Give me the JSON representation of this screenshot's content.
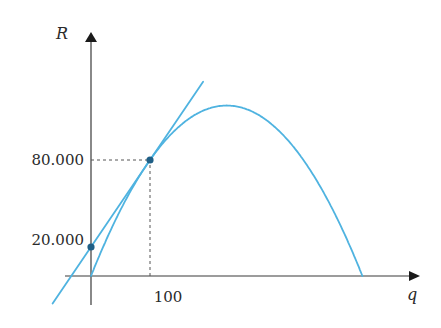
{
  "chart_data": {
    "type": "line",
    "title": "",
    "xlabel": "q",
    "ylabel": "R",
    "xlim": [
      -40,
      540
    ],
    "ylim": [
      -18000,
      165000
    ],
    "grid": false,
    "legend": "none",
    "x_ticks": [
      {
        "value": 100,
        "label": "100"
      }
    ],
    "y_ticks": [
      {
        "value": 20000,
        "label": "20.000"
      },
      {
        "value": 80000,
        "label": "80.000"
      }
    ],
    "series": [
      {
        "name": "revenue-curve",
        "kind": "parabola",
        "description": "Concave revenue curve R(q) through origin, passing (100, 80000), returning to 0 near q = 460",
        "points": [
          [
            0,
            0
          ],
          [
            50,
            45556
          ],
          [
            100,
            80000
          ],
          [
            150,
            103333
          ],
          [
            200,
            115556
          ],
          [
            230,
            117556
          ],
          [
            260,
            115556
          ],
          [
            300,
            106667
          ],
          [
            350,
            85556
          ],
          [
            400,
            53333
          ],
          [
            460,
            0
          ]
        ],
        "color": "#4fb3e0"
      },
      {
        "name": "tangent-line",
        "kind": "line",
        "description": "Tangent to revenue curve at q = 100, R-intercept 20000",
        "points": [
          [
            -65,
            -19000
          ],
          [
            190,
            134000
          ]
        ],
        "color": "#4fb3e0"
      }
    ],
    "highlighted_points": [
      {
        "name": "tangent-point",
        "x": 100,
        "y": 80000
      },
      {
        "name": "intercept-point",
        "x": 0,
        "y": 20000
      }
    ],
    "guides": [
      {
        "from": [
          0,
          80000
        ],
        "to": [
          100,
          80000
        ],
        "style": "dashed"
      },
      {
        "from": [
          100,
          0
        ],
        "to": [
          100,
          80000
        ],
        "style": "dashed"
      }
    ],
    "colors": {
      "curve": "#4fb3e0",
      "point": "#1f5f86",
      "axis": "#3a3a3a",
      "guide": "#555555"
    }
  }
}
